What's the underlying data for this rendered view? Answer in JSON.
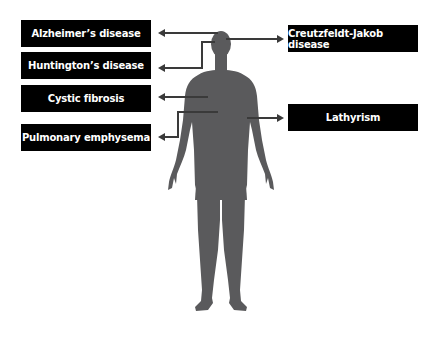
{
  "diagram": {
    "title": "",
    "figure": "human-body-silhouette",
    "colors": {
      "background": "#ffffff",
      "box_fill": "#000000",
      "box_text": "#ffffff",
      "body_fill": "#5a5a5c",
      "connector": "#3a3a3a"
    },
    "labels_left": [
      {
        "id": "alzheimers",
        "text": "Alzheimer’s disease"
      },
      {
        "id": "huntingtons",
        "text": "Huntington’s disease"
      },
      {
        "id": "cystic-fibrosis",
        "text": "Cystic fibrosis"
      },
      {
        "id": "pulmonary-emphysema",
        "text": "Pulmonary emphysema"
      }
    ],
    "labels_right": [
      {
        "id": "creutzfeldt-jakob",
        "text": "Creutzfeldt-Jakob disease"
      },
      {
        "id": "lathyrism",
        "text": "Lathyrism"
      }
    ]
  }
}
